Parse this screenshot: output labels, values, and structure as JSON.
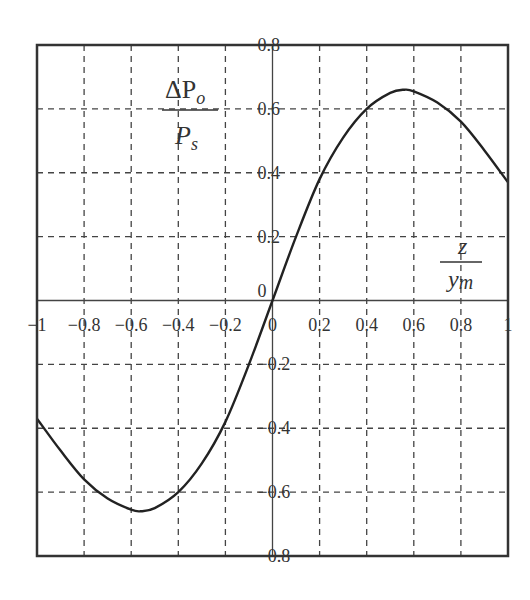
{
  "chart_data": {
    "type": "line",
    "title": "",
    "xlabel": "z / y_m",
    "ylabel": "ΔP_o / P_s",
    "xlim": [
      -1,
      1
    ],
    "ylim": [
      -0.8,
      0.8
    ],
    "grid": true,
    "grid_style": "dashed",
    "legend": null,
    "x_ticks": [
      "−1",
      "−0.8",
      "−0.6",
      "−0.4",
      "−0.2",
      "0",
      "0.2",
      "0.4",
      "0.6",
      "0.8",
      "1"
    ],
    "y_ticks": [
      "0.8",
      "0.6",
      "0.4",
      "0.2",
      "0",
      "−0.2",
      "−0.4",
      "−0.6",
      "−0.8"
    ],
    "series": [
      {
        "name": "ΔP_o/P_s",
        "x": [
          -1.0,
          -0.9,
          -0.8,
          -0.7,
          -0.6,
          -0.56,
          -0.5,
          -0.4,
          -0.3,
          -0.2,
          -0.1,
          0.0,
          0.1,
          0.2,
          0.3,
          0.4,
          0.5,
          0.56,
          0.6,
          0.7,
          0.8,
          0.9,
          1.0
        ],
        "values": [
          -0.37,
          -0.47,
          -0.56,
          -0.62,
          -0.655,
          -0.66,
          -0.65,
          -0.6,
          -0.51,
          -0.38,
          -0.2,
          0.0,
          0.2,
          0.38,
          0.51,
          0.6,
          0.65,
          0.66,
          0.655,
          0.62,
          0.56,
          0.47,
          0.37
        ]
      }
    ]
  },
  "labels": {
    "y_numerator": "ΔP",
    "y_numerator_sub": "o",
    "y_denominator": "P",
    "y_denominator_sub": "s",
    "x_numerator": "z",
    "x_denominator": "y",
    "x_denominator_sub": "m"
  },
  "colors": {
    "curve": "#222222",
    "frame": "#333333",
    "grid": "#444444",
    "background": "#ffffff"
  }
}
